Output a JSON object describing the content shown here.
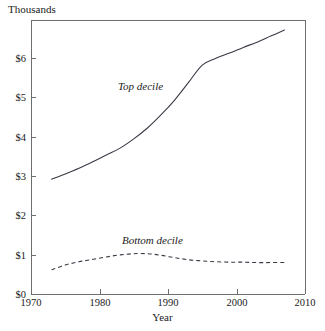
{
  "unit_label": "Thousands",
  "axis": {
    "x_title": "Year",
    "y_ticks": [
      "$0",
      "$1",
      "$2",
      "$3",
      "$4",
      "$5",
      "$6"
    ],
    "x_ticks": [
      "1970",
      "1980",
      "1990",
      "2000",
      "2010"
    ]
  },
  "series_labels": {
    "top": "Top decile",
    "bottom": "Bottom decile"
  },
  "colors": {
    "axis": "#6e6e6e",
    "line": "#3a3a46",
    "background": "#ffffff",
    "text": "#1a1a1a"
  },
  "chart_data": {
    "type": "line",
    "title": "",
    "subtitle": "",
    "unit_label": "Thousands",
    "xlabel": "Year",
    "ylabel": "",
    "xlim": [
      1970,
      2010
    ],
    "ylim": [
      0,
      6.8
    ],
    "xticks": [
      1970,
      1980,
      1990,
      2000,
      2010
    ],
    "yticks": [
      0,
      1,
      2,
      3,
      4,
      5,
      6
    ],
    "ytick_labels": [
      "$0",
      "$1",
      "$2",
      "$3",
      "$4",
      "$5",
      "$6"
    ],
    "grid": false,
    "legend": "inline-annotations",
    "series": [
      {
        "name": "Top decile",
        "style": "solid",
        "x": [
          1973,
          1975,
          1977,
          1979,
          1981,
          1983,
          1985,
          1987,
          1989,
          1991,
          1993,
          1995,
          1997,
          1999,
          2001,
          2003,
          2005,
          2007
        ],
        "values": [
          2.85,
          2.98,
          3.12,
          3.28,
          3.45,
          3.62,
          3.85,
          4.12,
          4.45,
          4.82,
          5.25,
          5.68,
          5.85,
          5.98,
          6.12,
          6.25,
          6.4,
          6.55
        ]
      },
      {
        "name": "Bottom decile",
        "style": "dashed",
        "x": [
          1973,
          1975,
          1977,
          1979,
          1981,
          1983,
          1985,
          1987,
          1989,
          1991,
          1993,
          1995,
          1997,
          1999,
          2001,
          2003,
          2005,
          2007
        ],
        "values": [
          0.6,
          0.72,
          0.8,
          0.86,
          0.92,
          0.97,
          1.0,
          1.0,
          0.96,
          0.9,
          0.85,
          0.82,
          0.8,
          0.79,
          0.79,
          0.78,
          0.78,
          0.78
        ]
      }
    ]
  }
}
